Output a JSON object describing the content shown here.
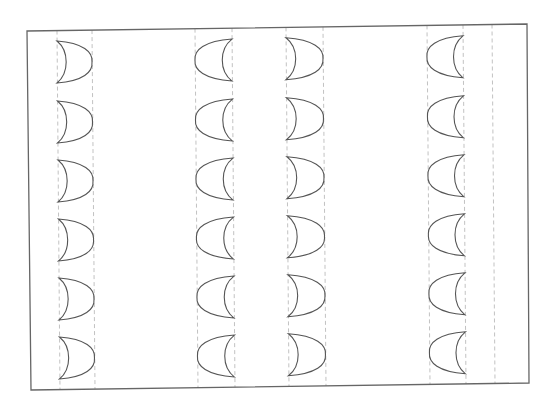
{
  "canvas": {
    "width": 557,
    "height": 409,
    "background": "#ffffff"
  },
  "frame": {
    "corners": [
      [
        27,
        31
      ],
      [
        527,
        24
      ],
      [
        529,
        383
      ],
      [
        31,
        390
      ]
    ],
    "stroke": "#666666"
  },
  "guides": {
    "stroke": "#bbbbbb",
    "dash": "4 3",
    "x_top": [
      57,
      92,
      195,
      232,
      286,
      323,
      427,
      463,
      492
    ]
  },
  "shapes": {
    "stroke": "#555555",
    "rows_y_top": [
      41,
      101,
      160,
      219,
      278,
      337
    ],
    "height": 42,
    "columns": [
      {
        "x_left": 57,
        "x_right": 92,
        "orientation": "right"
      },
      {
        "x_left": 195,
        "x_right": 232,
        "orientation": "left"
      },
      {
        "x_left": 286,
        "x_right": 323,
        "orientation": "right"
      },
      {
        "x_left": 427,
        "x_right": 463,
        "orientation": "left"
      }
    ]
  }
}
